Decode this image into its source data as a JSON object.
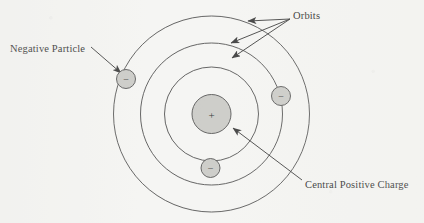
{
  "figure": {
    "kind": "atomic-model-diagram",
    "background_color": "#f5f5f3",
    "ink_color": "#3a3a3a",
    "text_color": "#1a1a1a",
    "particle_fill": "#c8c8c4",
    "particle_stroke": "#4a4a4a"
  },
  "labels": {
    "negative_particle": "Negative Particle",
    "orbits": "Orbits",
    "central_positive_charge": "Central Positive Charge"
  },
  "nucleus": {
    "symbol": "+",
    "cx": 211.5,
    "cy": 114,
    "r": 19.5
  },
  "orbits": [
    {
      "name": "inner-orbit",
      "cx": 211.5,
      "cy": 114,
      "r": 47
    },
    {
      "name": "middle-orbit",
      "cx": 211.5,
      "cy": 114,
      "r": 71
    },
    {
      "name": "outer-orbit",
      "cx": 211.5,
      "cy": 114,
      "r": 98
    }
  ],
  "electrons": [
    {
      "name": "electron-outer-left",
      "symbol": "−",
      "cx": 126,
      "cy": 79,
      "r": 9.5,
      "orbit": "outer-orbit"
    },
    {
      "name": "electron-middle-right",
      "symbol": "−",
      "cx": 281,
      "cy": 96,
      "r": 9.5,
      "orbit": "middle-orbit"
    },
    {
      "name": "electron-inner-bottom",
      "symbol": "−",
      "cx": 210.5,
      "cy": 168,
      "r": 9.5,
      "orbit": "inner-orbit"
    }
  ],
  "leader_lines": [
    {
      "name": "leader-negative-particle",
      "x1": 91,
      "y1": 47,
      "x2": 121,
      "y2": 73
    },
    {
      "name": "leader-orbits-outer",
      "x1": 290,
      "y1": 19,
      "x2": 248,
      "y2": 21
    },
    {
      "name": "leader-orbits-middle",
      "x1": 290,
      "y1": 19,
      "x2": 231,
      "y2": 43
    },
    {
      "name": "leader-orbits-inner",
      "x1": 290,
      "y1": 19,
      "x2": 232,
      "y2": 58
    },
    {
      "name": "leader-central-charge",
      "x1": 302,
      "y1": 180,
      "x2": 233,
      "y2": 128
    }
  ]
}
